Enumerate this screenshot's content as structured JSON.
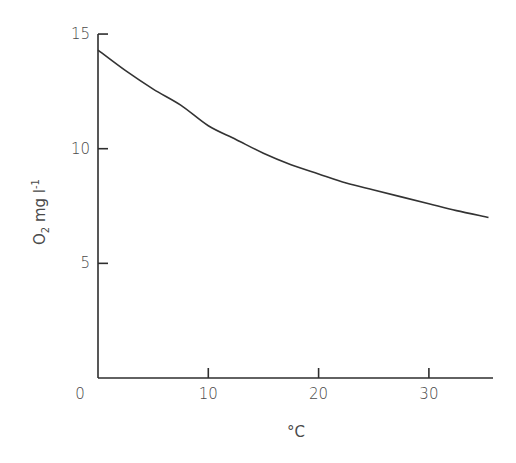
{
  "chart_data": {
    "type": "line",
    "title": "",
    "xlabel": "°C",
    "ylabel": "O2 mg l-1",
    "ylabel_parts": {
      "main": "O",
      "sub": "2",
      "mid": " mg l",
      "sup": "-1"
    },
    "xlim": [
      0,
      35
    ],
    "ylim": [
      0,
      15
    ],
    "x_ticks": [
      0,
      10,
      20,
      30
    ],
    "x_tick_labels": [
      "0",
      "10",
      "20",
      "30"
    ],
    "y_ticks": [
      5,
      10,
      15
    ],
    "y_tick_labels": [
      "5",
      "10",
      "15"
    ],
    "grid": false,
    "legend": null,
    "series": [
      {
        "name": "Dissolved oxygen saturation",
        "x": [
          0,
          2.5,
          5,
          7.5,
          10,
          12.5,
          15,
          17.5,
          20,
          22.5,
          25,
          27.5,
          30,
          32.5,
          35.4
        ],
        "values": [
          14.3,
          13.4,
          12.6,
          11.9,
          11.0,
          10.4,
          9.8,
          9.3,
          8.9,
          8.5,
          8.2,
          7.9,
          7.6,
          7.3,
          7.0
        ]
      }
    ]
  }
}
